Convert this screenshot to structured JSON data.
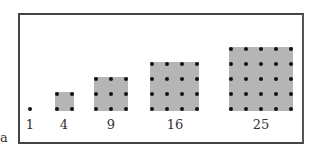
{
  "figure": {
    "items": [
      {
        "n": 1,
        "label": "1"
      },
      {
        "n": 2,
        "label": "4"
      },
      {
        "n": 3,
        "label": "9"
      },
      {
        "n": 4,
        "label": "16"
      },
      {
        "n": 5,
        "label": "25"
      }
    ],
    "stray_text": "a"
  },
  "colors": {
    "frame": "#444444",
    "square_fill": "#b5b5b5",
    "dot": "#111111"
  }
}
